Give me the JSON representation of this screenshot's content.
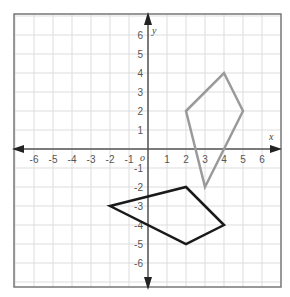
{
  "graph": {
    "x_axis_label": "x",
    "y_axis_label": "y",
    "origin_label": "o",
    "x_range": [
      -6,
      6
    ],
    "y_range": [
      -6,
      6
    ],
    "x_ticks": [
      "-6",
      "-5",
      "-4",
      "-3",
      "-2",
      "-1",
      "1",
      "2",
      "3",
      "4",
      "5",
      "6"
    ],
    "y_ticks": [
      "6",
      "5",
      "4",
      "3",
      "2",
      "1",
      "-1",
      "-2",
      "-3",
      "-4",
      "-5",
      "-6"
    ],
    "grid": true,
    "colors": {
      "grid": "#dddddd",
      "axis": "#555555",
      "border": "#777777",
      "gray_shape": "#9a9a9a",
      "black_shape": "#1a1a1a"
    }
  },
  "shapes": [
    {
      "name": "gray-quadrilateral",
      "color": "#9a9a9a",
      "vertices": [
        [
          2,
          2
        ],
        [
          4,
          4
        ],
        [
          5,
          2
        ],
        [
          3,
          -2
        ]
      ]
    },
    {
      "name": "black-quadrilateral",
      "color": "#1a1a1a",
      "vertices": [
        [
          -2,
          -3
        ],
        [
          2,
          -2
        ],
        [
          4,
          -4
        ],
        [
          2,
          -5
        ]
      ]
    }
  ]
}
